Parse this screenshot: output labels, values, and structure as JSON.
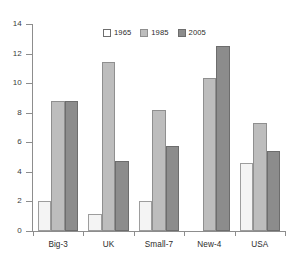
{
  "chart_data": {
    "type": "bar",
    "title": "",
    "subtitle": "",
    "xlabel": "",
    "ylabel": "",
    "categories": [
      "Big-3",
      "UK",
      "Small-7",
      "New-4",
      "USA"
    ],
    "series": [
      {
        "name": "1965",
        "color": "#f4f4f4",
        "values": [
          2.0,
          1.15,
          2.0,
          null,
          4.6
        ]
      },
      {
        "name": "1985",
        "color": "#bdbdbd",
        "values": [
          8.8,
          11.4,
          8.2,
          10.35,
          7.3
        ]
      },
      {
        "name": "2005",
        "color": "#8c8c8c",
        "values": [
          8.8,
          4.75,
          5.75,
          12.5,
          5.4
        ]
      }
    ],
    "ylim": [
      0,
      14
    ],
    "yticks": [
      0,
      2,
      4,
      6,
      8,
      10,
      12,
      14
    ],
    "ytick_labels": [
      "0",
      "2",
      "4",
      "6",
      "8",
      "10",
      "12",
      "14"
    ],
    "grid": false,
    "legend_position": "top-center",
    "legend_entries": [
      "1965",
      "1985",
      "2005"
    ],
    "annotations": []
  }
}
